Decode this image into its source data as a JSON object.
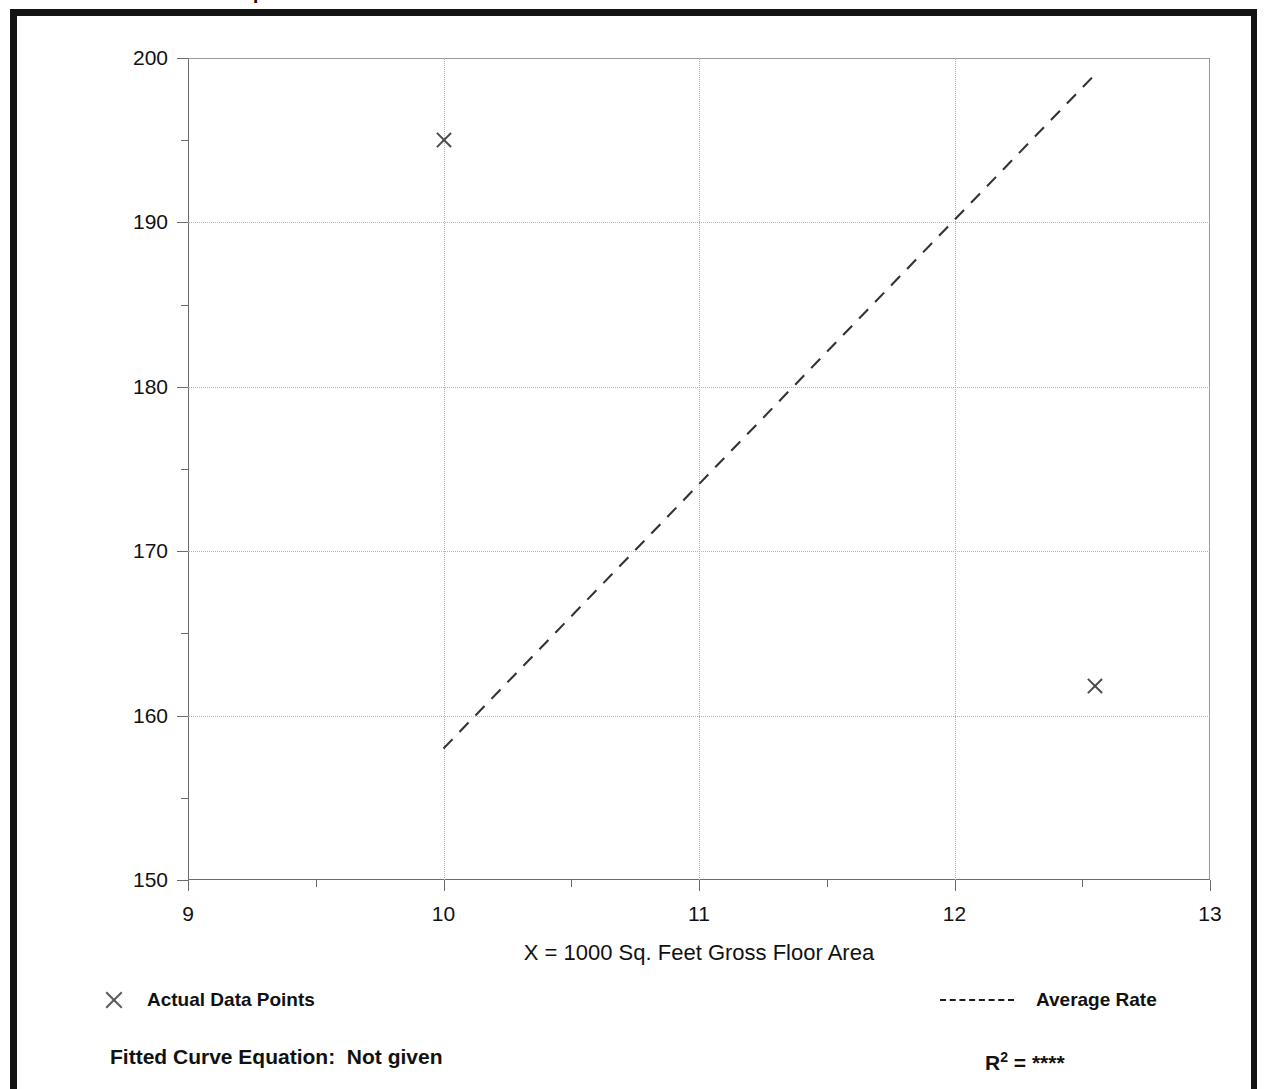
{
  "frame": {
    "top_fragment_text": "I"
  },
  "axes": {
    "y_title": "T = Average Vehicle Trip Ends",
    "x_title": "X = 1000 Sq. Feet Gross Floor Area",
    "y_ticks": [
      150,
      160,
      170,
      180,
      190,
      200
    ],
    "y_minor_ticks": [
      155,
      165,
      175,
      185,
      195
    ],
    "x_ticks": [
      9,
      10,
      11,
      12,
      13
    ],
    "x_minor_ticks": [
      9.5,
      10.5,
      11.5,
      12.5
    ]
  },
  "legend": {
    "data_points_label": "Actual Data Points",
    "data_points_icon": "x-marker-icon",
    "average_rate_label": "Average Rate",
    "average_rate_icon": "dashed-line-icon"
  },
  "footer": {
    "equation_label": "Fitted Curve Equation:",
    "equation_value": "Not given",
    "r2_label": "R",
    "r2_exponent": "2",
    "r2_equals": "=",
    "r2_value": "****"
  },
  "colors": {
    "frame": "#141414",
    "grid": "#b4b4b4",
    "axis": "#6b6b6b",
    "marker": "#4a4a4a",
    "trend": "#333333",
    "text": "#111111"
  },
  "chart_data": {
    "type": "scatter",
    "title": "",
    "xlabel": "X = 1000 Sq. Feet Gross Floor Area",
    "ylabel": "T = Average Vehicle Trip Ends",
    "xlim": [
      9,
      13
    ],
    "ylim": [
      150,
      200
    ],
    "grid": true,
    "legend_position": "below-plot",
    "series": [
      {
        "name": "Actual Data Points",
        "type": "scatter",
        "marker": "x",
        "points": [
          {
            "x": 10.0,
            "y": 195.0
          },
          {
            "x": 12.55,
            "y": 161.8
          }
        ]
      },
      {
        "name": "Average Rate",
        "type": "line",
        "style": "dashed",
        "points": [
          {
            "x": 10.0,
            "y": 158.0
          },
          {
            "x": 12.55,
            "y": 199.0
          }
        ]
      }
    ],
    "annotations": [
      "Fitted Curve Equation:  Not given",
      "R2 = ****"
    ]
  }
}
